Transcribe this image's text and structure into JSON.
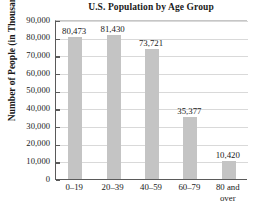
{
  "chart_data": {
    "type": "bar",
    "title": "U.S. Population by Age Group",
    "xlabel": "",
    "ylabel": "Number of People (in Thousands)",
    "categories": [
      "0–19",
      "20–39",
      "40–59",
      "60–79",
      "80 and over"
    ],
    "category_lines": [
      [
        "0–19"
      ],
      [
        "20–39"
      ],
      [
        "40–59"
      ],
      [
        "60–79"
      ],
      [
        "80 and",
        "over"
      ]
    ],
    "values": [
      80473,
      81430,
      73721,
      35377,
      10420
    ],
    "value_labels": [
      "80,473",
      "81,430",
      "73,721",
      "35,377",
      "10,420"
    ],
    "ylim": [
      0,
      90000
    ],
    "ytick_values": [
      90000,
      80000,
      70000,
      60000,
      50000,
      40000,
      30000,
      20000,
      10000,
      0
    ],
    "ytick_labels": [
      "90,000",
      "80,000",
      "70,000",
      "60,000",
      "50,000",
      "40,000",
      "30,000",
      "20,000",
      "10,000",
      "0"
    ],
    "grid": true,
    "grid_axis": "y",
    "legend": false,
    "bar_color": "#c4c4c4",
    "axis_color": "#5a5a5a",
    "grid_color": "#d9d9d9",
    "background_color": "#ffffff",
    "text_color": "#1a1a1a"
  }
}
